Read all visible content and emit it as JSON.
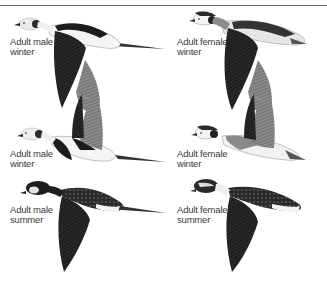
{
  "plate": {
    "subject": "Long-tailed Duck plumages in flight",
    "figures": [
      {
        "id": "male-winter-top",
        "label_line1": "Adult male",
        "label_line2": "winter"
      },
      {
        "id": "female-winter-top",
        "label_line1": "Adult female",
        "label_line2": "winter"
      },
      {
        "id": "male-winter-mid",
        "label_line1": "Adult male",
        "label_line2": "winter"
      },
      {
        "id": "female-winter-mid",
        "label_line1": "Adult female",
        "label_line2": "winter"
      },
      {
        "id": "male-summer",
        "label_line1": "Adult male",
        "label_line2": "summer"
      },
      {
        "id": "female-summer",
        "label_line1": "Adult female",
        "label_line2": "summer"
      }
    ]
  },
  "colors": {
    "rule": "#6a6a6a",
    "dark_plumage": "#1c1c1c",
    "mid_plumage": "#5a5a5a",
    "light_plumage": "#9a9a9a",
    "pale": "#e8e8e8",
    "background": "#ffffff"
  }
}
